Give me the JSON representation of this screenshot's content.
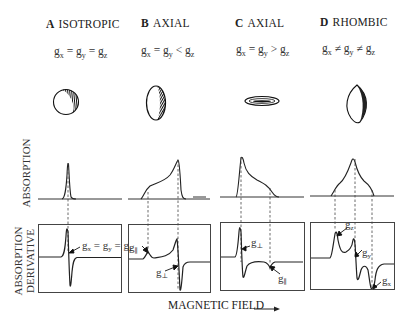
{
  "panels": [
    {
      "letter": "A",
      "title": "ISOTROPIC",
      "relation": [
        "g",
        "x",
        " = ",
        "g",
        "y",
        " = ",
        "g",
        "z"
      ],
      "shape": "sphere",
      "derivative_label": "gₓ = gᵧ = gᵩ"
    },
    {
      "letter": "B",
      "title": "AXIAL",
      "relation": [
        "g",
        "x",
        " = ",
        "g",
        "y",
        " < ",
        "g",
        "z"
      ],
      "shape": "prolate-spheroid",
      "derivative_labels": [
        "g∥",
        "g⊥"
      ]
    },
    {
      "letter": "C",
      "title": "AXIAL",
      "relation": [
        "g",
        "x",
        " = ",
        "g",
        "y",
        " > ",
        "g",
        "z"
      ],
      "shape": "oblate-spheroid",
      "derivative_labels": [
        "g⊥",
        "g∥"
      ]
    },
    {
      "letter": "D",
      "title": "RHOMBIC",
      "relation": [
        "g",
        "x",
        " ≠ ",
        "g",
        "y",
        " ≠ ",
        "g",
        "z"
      ],
      "shape": "ellipsoid",
      "derivative_labels": [
        "gᵩ",
        "gᵧ",
        "gₓ"
      ]
    }
  ],
  "labels": {
    "absorption": "ABSORPTION",
    "derivative_line1": "ABSORPTION",
    "derivative_line2": "DERIVATIVE",
    "magnetic_field": "MAGNETIC FIELD",
    "arrow": "——▸"
  },
  "derivative_text": {
    "a_gx": "g",
    "a_gx_sub": "x",
    "a_eq1": " = g",
    "a_gy_sub": "y",
    "a_eq2": " = g",
    "a_gz_sub": "z",
    "b_gpar": "g",
    "b_gpar_sub": "∥",
    "b_gperp": "g",
    "b_gperp_sub": "⊥",
    "c_gperp": "g",
    "c_gperp_sub": "⊥",
    "c_gpar": "g",
    "c_gpar_sub": "∥",
    "d_gz": "g",
    "d_gz_sub": "z",
    "d_gy": "g",
    "d_gy_sub": "y",
    "d_gx": "g",
    "d_gx_sub": "x"
  }
}
